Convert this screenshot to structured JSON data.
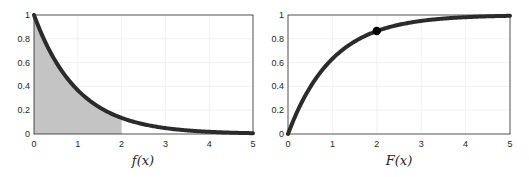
{
  "chart_data": [
    {
      "type": "line",
      "title": "",
      "xlabel": "f(x)",
      "ylabel": "",
      "xlim": [
        0,
        5
      ],
      "ylim": [
        0,
        1
      ],
      "xticks": [
        "0",
        "1",
        "2",
        "3",
        "4",
        "5"
      ],
      "yticks": [
        "0",
        "0.2",
        "0.4",
        "0.6",
        "0.8",
        "1"
      ],
      "grid": true,
      "series": [
        {
          "name": "f(x) = e^{-x}",
          "x": [
            0,
            0.5,
            1,
            1.5,
            2,
            2.5,
            3,
            3.5,
            4,
            4.5,
            5
          ],
          "values": [
            1,
            0.607,
            0.368,
            0.223,
            0.135,
            0.082,
            0.05,
            0.03,
            0.018,
            0.011,
            0.007
          ]
        }
      ],
      "shaded_region": {
        "x_from": 0,
        "x_to": 2,
        "under": "f(x)",
        "color": "#c4c4c4"
      }
    },
    {
      "type": "line",
      "title": "",
      "xlabel": "F(x)",
      "ylabel": "",
      "xlim": [
        0,
        5
      ],
      "ylim": [
        0,
        1
      ],
      "xticks": [
        "0",
        "1",
        "2",
        "3",
        "4",
        "5"
      ],
      "yticks": [
        "0",
        "0.2",
        "0.4",
        "0.6",
        "0.8",
        "1"
      ],
      "grid": true,
      "series": [
        {
          "name": "F(x) = 1 - e^{-x}",
          "x": [
            0,
            0.5,
            1,
            1.5,
            2,
            2.5,
            3,
            3.5,
            4,
            4.5,
            5
          ],
          "values": [
            0,
            0.393,
            0.632,
            0.777,
            0.865,
            0.918,
            0.95,
            0.97,
            0.982,
            0.989,
            0.993
          ]
        }
      ],
      "marker": {
        "x": 2,
        "y": 0.865
      }
    }
  ],
  "left": {
    "xlabel": "f(x)",
    "xticks": [
      "0",
      "1",
      "2",
      "3",
      "4",
      "5"
    ],
    "yticks": [
      "0",
      "0.2",
      "0.4",
      "0.6",
      "0.8",
      "1"
    ]
  },
  "right": {
    "xlabel": "F(x)",
    "xticks": [
      "0",
      "1",
      "2",
      "3",
      "4",
      "5"
    ],
    "yticks": [
      "0",
      "0.2",
      "0.4",
      "0.6",
      "0.8",
      "1"
    ]
  },
  "colors": {
    "curve": "#2b2b2b",
    "shade": "#c4c4c4",
    "axis": "#262626",
    "grid": "#ececec"
  }
}
